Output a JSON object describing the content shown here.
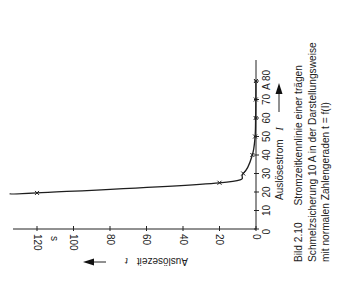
{
  "chart_data": {
    "type": "line",
    "orientation": "rotated-90",
    "title": "Bild 2.10 Stromzeitkennlinie einer trägen Schmelzsicherung 10 A in der Darstellungsweise mit normalen Zahlengeraden t = f(I)",
    "xlabel": "Auslösestrom I",
    "xunit": "A",
    "ylabel": "Auslösezeit t",
    "yunit": "s",
    "xlim": [
      0,
      80
    ],
    "ylim": [
      0,
      130
    ],
    "x_ticks": [
      0,
      10,
      20,
      30,
      40,
      50,
      60,
      70,
      80
    ],
    "y_ticks": [
      0,
      20,
      40,
      60,
      80,
      100,
      120
    ],
    "grid": false,
    "legend": null,
    "series": [
      {
        "name": "Stromzeitkennlinie träge 10 A",
        "x": [
          19.0,
          19.5,
          25,
          30,
          40,
          50,
          60,
          70,
          80
        ],
        "y": [
          135,
          120,
          20,
          7,
          2,
          0.5,
          0.2,
          0.1,
          0.05
        ],
        "markers": [
          {
            "I": 19.5,
            "t": 120
          },
          {
            "I": 25,
            "t": 20
          },
          {
            "I": 30,
            "t": 7
          },
          {
            "I": 40,
            "t": 2
          },
          {
            "I": 50,
            "t": 0.5
          },
          {
            "I": 60,
            "t": 0.2
          },
          {
            "I": 70,
            "t": 0.1
          },
          {
            "I": 80,
            "t": 0.05
          }
        ]
      }
    ]
  },
  "labels": {
    "current_axis": "Auslösestrom",
    "current_symbol": "I",
    "time_axis": "Auslösezeit",
    "time_symbol": "t",
    "time_unit": "s",
    "current_unit": "A"
  },
  "caption": {
    "figure_number": "Bild 2.10",
    "line1": "Stromzeitkennlinie einer trägen",
    "line2": "Schmelzsicherung 10 A in der Darstellungsweise",
    "line3": "mit normalen Zahlengeraden t = f(I)"
  }
}
